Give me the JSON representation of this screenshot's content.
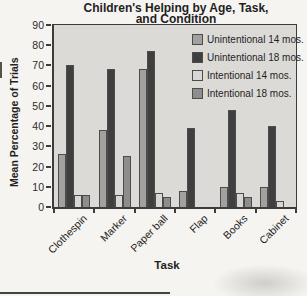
{
  "figure": {
    "title_line1": "Children's Helping by Age, Task,",
    "title_line2": "and Condition"
  },
  "chart_data": {
    "type": "bar",
    "title": "Children's Helping by Age, Task, and Condition",
    "xlabel": "Task",
    "ylabel": "Mean Percentage of Trials",
    "ylim": [
      0,
      90
    ],
    "ytick_step": 10,
    "grid": false,
    "legend_position": "top-right-inside",
    "categories": [
      "Clothespin",
      "Marker",
      "Paper ball",
      "Flap",
      "Books",
      "Cabinet"
    ],
    "series": [
      {
        "name": "Unintentional 14 mos.",
        "color": "#a2a19f",
        "values": [
          26,
          38,
          68,
          8,
          10,
          10
        ]
      },
      {
        "name": "Unintentional 18 mos.",
        "color": "#3f3f3f",
        "values": [
          70,
          68,
          77,
          39,
          48,
          40
        ]
      },
      {
        "name": "Intentional 14 mos.",
        "color": "#d8d7d4",
        "values": [
          6,
          6,
          7,
          0,
          7,
          3
        ]
      },
      {
        "name": "Intentional 18 mos.",
        "color": "#8e8d8b",
        "values": [
          6,
          25,
          5,
          0,
          5,
          0
        ]
      }
    ]
  },
  "colors": {
    "page_bg": "#f5f4f1",
    "plot_bg": "#dbdad7",
    "axis": "#3c3c3c",
    "bar_border": "#4c4c4c",
    "text": "#1f1f1f"
  }
}
